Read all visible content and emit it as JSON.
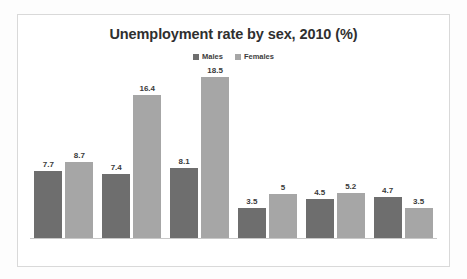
{
  "chart_data": {
    "type": "bar",
    "title": "Unemployment rate by sex, 2010 (%)",
    "xlabel": "",
    "ylabel": "",
    "ylim": [
      0,
      20
    ],
    "grid": false,
    "legend_position": "top-center",
    "categories": [
      "",
      "",
      "",
      "",
      "",
      ""
    ],
    "series": [
      {
        "name": "Males",
        "color": "#6e6e6e",
        "values": [
          7.7,
          7.4,
          8.1,
          3.5,
          4.5,
          4.7
        ],
        "labels": [
          "7.7",
          "7.4",
          "8.1",
          "3.5",
          "4.5",
          "4.7"
        ]
      },
      {
        "name": "Females",
        "color": "#a6a6a6",
        "values": [
          8.7,
          16.4,
          18.5,
          5,
          5.2,
          3.5
        ],
        "labels": [
          "8.7",
          "16.4",
          "18.5",
          "5",
          "5.2",
          "3.5"
        ]
      }
    ]
  },
  "legend": {
    "items": [
      {
        "label": "Males",
        "color": "#6e6e6e",
        "marker": "square-marker"
      },
      {
        "label": "Females",
        "color": "#a6a6a6",
        "marker": "square-marker"
      }
    ]
  }
}
